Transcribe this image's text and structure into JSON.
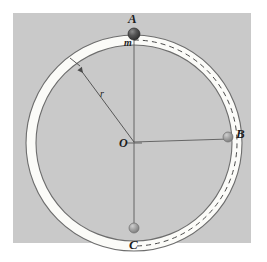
{
  "figure": {
    "kind": "physics-diagram",
    "panel": {
      "background_color": "#c9c9c9",
      "outer_background_color": "#ffffff"
    }
  },
  "colors": {
    "panel_gray": "#c9c9c9",
    "tube_fill": "#fbfbf8",
    "tube_stroke": "#6d6d6d",
    "line_stroke": "#555555",
    "dash_stroke": "#4a4a4a",
    "ball_dark": "#4a4a4a",
    "ball_light": "#9a9a9a",
    "text": "#1d1d1d"
  },
  "geometry": {
    "center": {
      "x": 134,
      "y": 143
    },
    "tube_outer_radius": 108,
    "tube_inner_radius": 98,
    "dash_radius": 103,
    "radius_arrow": {
      "from_x": 134,
      "from_y": 143,
      "to_x": 77,
      "to_y": 66
    }
  },
  "labels": {
    "point_a": "A",
    "point_b": "B",
    "point_c": "C",
    "center": "O",
    "mass": "m",
    "radius": "r"
  },
  "markers": [
    {
      "name": "ball-a",
      "label": "A",
      "x": 134,
      "y": 34,
      "radius": 6,
      "shade": "dark"
    },
    {
      "name": "ball-b",
      "label": "B",
      "x": 228,
      "y": 136,
      "radius": 5,
      "shade": "light"
    },
    {
      "name": "ball-c",
      "label": "C",
      "x": 134,
      "y": 228,
      "radius": 5,
      "shade": "light"
    }
  ],
  "guide_lines": [
    {
      "name": "vertical-axis",
      "x1": 134,
      "y1": 34,
      "x2": 134,
      "y2": 228
    },
    {
      "name": "horizontal-radius",
      "x1": 134,
      "y1": 143,
      "x2": 228,
      "y2": 140
    }
  ]
}
